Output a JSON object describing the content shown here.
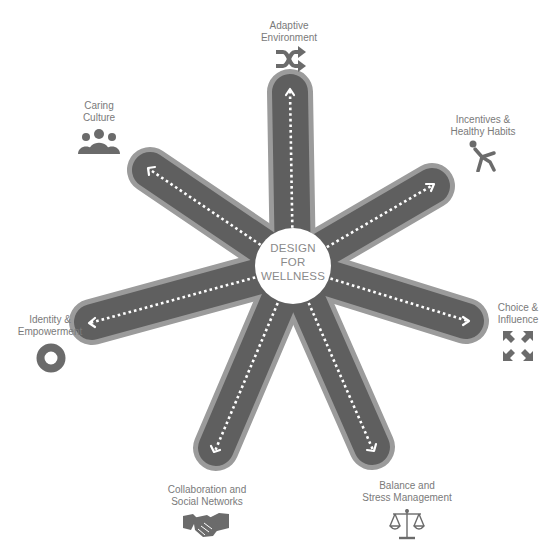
{
  "center": {
    "line1": "DESIGN",
    "line2": "FOR",
    "line3": "WELLNESS"
  },
  "colors": {
    "arm_outer": "#9b9b9b",
    "arm_inner": "#5f5f5f",
    "dots": "#ffffff",
    "hub": "#ffffff",
    "text": "#7a7a7a",
    "icon": "#6b6b6b"
  },
  "nodes": [
    {
      "id": "adaptive-environment",
      "line1": "Adaptive",
      "line2": "Environment",
      "icon": "shuffle-icon"
    },
    {
      "id": "incentives",
      "line1": "Incentives &",
      "line2": "Healthy Habits",
      "icon": "person-running-icon"
    },
    {
      "id": "choice",
      "line1": "Choice &",
      "line2": "Influence",
      "icon": "expand-arrows-icon"
    },
    {
      "id": "balance",
      "line1": "Balance and",
      "line2": "Stress Management",
      "icon": "scales-icon"
    },
    {
      "id": "collaboration",
      "line1": "Collaboration and",
      "line2": "Social Networks",
      "icon": "handshake-icon"
    },
    {
      "id": "identity",
      "line1": "Identity &",
      "line2": "Empowerment",
      "icon": "ring-icon"
    },
    {
      "id": "caring-culture",
      "line1": "Caring",
      "line2": "Culture",
      "icon": "people-group-icon"
    }
  ]
}
